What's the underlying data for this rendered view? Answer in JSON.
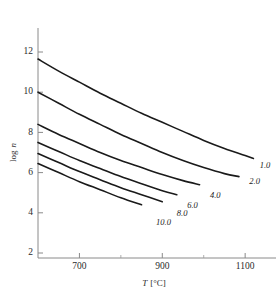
{
  "chart_data": {
    "type": "line",
    "title": "",
    "subtitle": "",
    "xlabel": "T [°C]",
    "ylabel": "log n",
    "xlabel_parts": {
      "symbol": "T",
      "unit": "[°C]"
    },
    "ylabel_parts": {
      "func": "log",
      "symbol": "n"
    },
    "xlim": [
      600,
      1160
    ],
    "ylim": [
      1.2,
      12.6
    ],
    "x_ticks": [
      700,
      900,
      1100
    ],
    "x_tick_labels": [
      "700",
      "900",
      "1100"
    ],
    "x_minor_ticks": [
      800,
      1000
    ],
    "y_ticks": [
      2,
      4,
      6,
      8,
      10,
      12
    ],
    "y_tick_labels": [
      "2",
      "4",
      "6",
      "8",
      "10",
      "12"
    ],
    "grid": false,
    "legend_position": "inline-right-of-curve-ends",
    "series": [
      {
        "name": "1.0",
        "label": "1.0",
        "label_at": {
          "x": 1135,
          "y": 6.35
        },
        "x": [
          600,
          650,
          700,
          750,
          800,
          850,
          900,
          950,
          1000,
          1050,
          1100,
          1120
        ],
        "y": [
          11.65,
          11.05,
          10.5,
          9.95,
          9.45,
          8.95,
          8.5,
          8.05,
          7.6,
          7.2,
          6.85,
          6.7
        ]
      },
      {
        "name": "2.0",
        "label": "2.0",
        "label_at": {
          "x": 1110,
          "y": 5.55
        },
        "x": [
          600,
          650,
          700,
          750,
          800,
          850,
          900,
          950,
          1000,
          1050,
          1085
        ],
        "y": [
          10.0,
          9.45,
          8.9,
          8.4,
          7.9,
          7.45,
          7.0,
          6.6,
          6.25,
          5.95,
          5.8
        ]
      },
      {
        "name": "4.0",
        "label": "4.0",
        "label_at": {
          "x": 1015,
          "y": 4.85
        },
        "x": [
          600,
          650,
          700,
          750,
          800,
          850,
          900,
          950,
          990
        ],
        "y": [
          8.4,
          7.9,
          7.45,
          7.0,
          6.6,
          6.25,
          5.9,
          5.6,
          5.4
        ]
      },
      {
        "name": "6.0",
        "label": "6.0",
        "label_at": {
          "x": 960,
          "y": 4.35
        },
        "x": [
          600,
          650,
          700,
          750,
          800,
          850,
          900,
          935
        ],
        "y": [
          7.5,
          7.05,
          6.6,
          6.2,
          5.8,
          5.45,
          5.1,
          4.9
        ]
      },
      {
        "name": "8.0",
        "label": "8.0",
        "label_at": {
          "x": 935,
          "y": 3.95
        },
        "x": [
          600,
          650,
          700,
          750,
          800,
          850,
          900
        ],
        "y": [
          6.95,
          6.5,
          6.05,
          5.65,
          5.25,
          4.9,
          4.55
        ]
      },
      {
        "name": "10.0",
        "label": "10.0",
        "label_at": {
          "x": 885,
          "y": 3.5
        },
        "x": [
          600,
          650,
          700,
          750,
          800,
          850
        ],
        "y": [
          6.45,
          6.0,
          5.55,
          5.15,
          4.75,
          4.4
        ]
      }
    ],
    "colors": {
      "curve": "#1a1a1a",
      "axis": "#8a8a8a",
      "text": "#2b2b2b",
      "background": "#ffffff"
    }
  }
}
